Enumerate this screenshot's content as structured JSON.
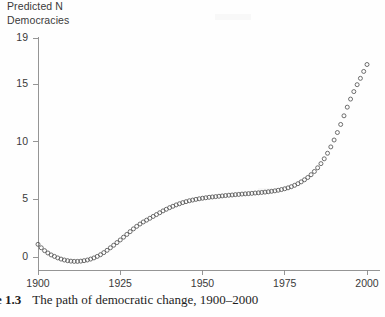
{
  "figure": {
    "axis_title_line1": "Predicted N",
    "axis_title_line2": "Democracies",
    "caption_number": "e 1.3",
    "caption_text": "The path of democratic change, 1900–2000",
    "marker_color": "#555555",
    "axis_color": "#8a8a8a",
    "text_color": "#3a3a3a"
  },
  "chart_data": {
    "type": "scatter",
    "title": "",
    "subtitle": "",
    "xlabel": "",
    "ylabel": "Predicted N Democracies",
    "xlim": [
      1898,
      2002
    ],
    "ylim": [
      -1.2,
      19.6
    ],
    "xticks": [
      1900,
      1925,
      1950,
      1975,
      2000
    ],
    "yticks": [
      0,
      5,
      10,
      15,
      19
    ],
    "xtick_labels": [
      "1900",
      "1925",
      "1950",
      "1975",
      "2000"
    ],
    "ytick_labels": [
      "0",
      "5",
      "10",
      "15",
      "19"
    ],
    "grid": false,
    "legend": false,
    "legend_position": "none",
    "marker": "open-circle",
    "series": [
      {
        "name": "Predicted N Democracies",
        "x": [
          1900,
          1901,
          1902,
          1903,
          1904,
          1905,
          1906,
          1907,
          1908,
          1909,
          1910,
          1911,
          1912,
          1913,
          1914,
          1915,
          1916,
          1917,
          1918,
          1919,
          1920,
          1921,
          1922,
          1923,
          1924,
          1925,
          1926,
          1927,
          1928,
          1929,
          1930,
          1931,
          1932,
          1933,
          1934,
          1935,
          1936,
          1937,
          1938,
          1939,
          1940,
          1941,
          1942,
          1943,
          1944,
          1945,
          1946,
          1947,
          1948,
          1949,
          1950,
          1951,
          1952,
          1953,
          1954,
          1955,
          1956,
          1957,
          1958,
          1959,
          1960,
          1961,
          1962,
          1963,
          1964,
          1965,
          1966,
          1967,
          1968,
          1969,
          1970,
          1971,
          1972,
          1973,
          1974,
          1975,
          1976,
          1977,
          1978,
          1979,
          1980,
          1981,
          1982,
          1983,
          1984,
          1985,
          1986,
          1987,
          1988,
          1989,
          1990,
          1991,
          1992,
          1993,
          1994,
          1995,
          1996,
          1997,
          1998,
          1999,
          2000
        ],
        "y": [
          1.1,
          0.8,
          0.55,
          0.35,
          0.18,
          0.05,
          -0.08,
          -0.18,
          -0.26,
          -0.32,
          -0.36,
          -0.38,
          -0.38,
          -0.36,
          -0.32,
          -0.26,
          -0.18,
          -0.08,
          0.05,
          0.2,
          0.38,
          0.58,
          0.8,
          1.02,
          1.25,
          1.48,
          1.72,
          1.96,
          2.2,
          2.44,
          2.66,
          2.86,
          3.04,
          3.2,
          3.36,
          3.52,
          3.68,
          3.84,
          4.0,
          4.14,
          4.28,
          4.4,
          4.52,
          4.62,
          4.72,
          4.8,
          4.88,
          4.94,
          5.0,
          5.05,
          5.1,
          5.14,
          5.18,
          5.21,
          5.24,
          5.27,
          5.3,
          5.33,
          5.36,
          5.38,
          5.41,
          5.43,
          5.46,
          5.48,
          5.5,
          5.52,
          5.55,
          5.57,
          5.6,
          5.63,
          5.66,
          5.7,
          5.74,
          5.79,
          5.85,
          5.92,
          6.0,
          6.1,
          6.22,
          6.36,
          6.52,
          6.7,
          6.9,
          7.14,
          7.42,
          7.74,
          8.1,
          8.52,
          9.0,
          9.55,
          10.15,
          10.8,
          11.5,
          12.25,
          13.0,
          13.7,
          14.35,
          14.95,
          15.5,
          16.1,
          16.7
        ]
      }
    ]
  }
}
